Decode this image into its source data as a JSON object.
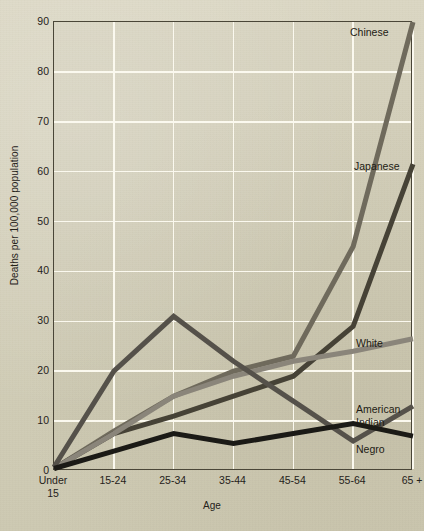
{
  "chart_data": {
    "type": "line",
    "title": "",
    "xlabel": "Age",
    "ylabel": "Deaths per 100,000 population",
    "categories": [
      "Under\n15",
      "15-24",
      "25-34",
      "35-44",
      "45-54",
      "55-64",
      "65 +"
    ],
    "xtick_labels": [
      "Under\n15",
      "15-24",
      "25-34",
      "35-44",
      "45-54",
      "55-64",
      "65 +"
    ],
    "ytick_labels": [
      "0",
      "10",
      "20",
      "30",
      "40",
      "50",
      "60",
      "70",
      "80",
      "90"
    ],
    "ytick_values": [
      0,
      10,
      20,
      30,
      40,
      50,
      60,
      70,
      80,
      90
    ],
    "ylim": [
      0,
      90
    ],
    "grid": true,
    "legend_position": "right-inline",
    "series": [
      {
        "name": "Chinese",
        "color": "#6f6a5c",
        "values": [
          0.5,
          8,
          15,
          20,
          23,
          45,
          90
        ],
        "label_x": 350,
        "label_y": 26
      },
      {
        "name": "Japanese",
        "color": "#464236",
        "values": [
          0.5,
          7.5,
          11,
          15,
          19,
          29,
          61.5
        ],
        "label_x": 354,
        "label_y": 160
      },
      {
        "name": "White",
        "color": "#8a857a",
        "values": [
          0.5,
          7.5,
          15,
          19,
          22,
          24,
          26.5
        ],
        "label_x": 356,
        "label_y": 337
      },
      {
        "name": "American\nIndian",
        "color": "#55514a",
        "values": [
          0.8,
          20,
          31,
          22,
          14,
          6,
          13
        ],
        "label_x": 356,
        "label_y": 403
      },
      {
        "name": "Negro",
        "color": "#1b1a16",
        "values": [
          0.5,
          4,
          7.5,
          5.5,
          7.5,
          9.5,
          7
        ],
        "label_x": 356,
        "label_y": 443
      }
    ]
  }
}
